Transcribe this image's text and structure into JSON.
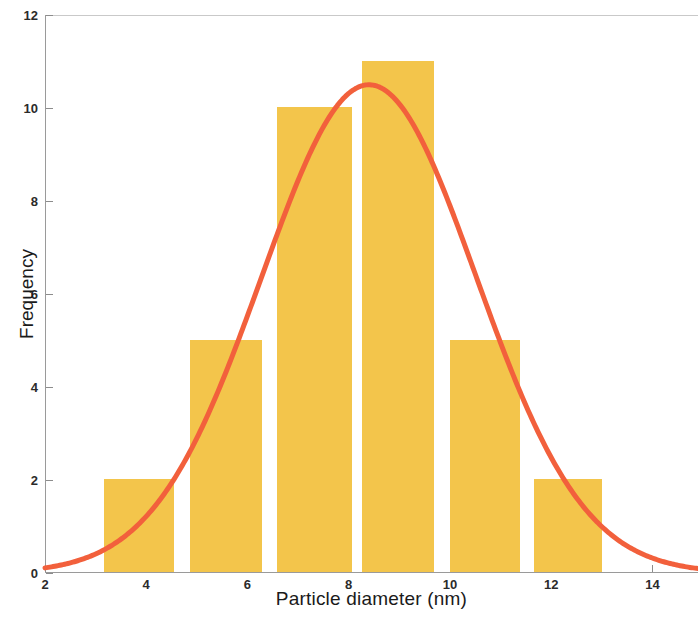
{
  "chart_data": {
    "type": "bar",
    "title": "",
    "subtitle": "",
    "xlabel": "Particle diameter (nm)",
    "ylabel": "Frequency",
    "xlim": [
      2,
      14.9
    ],
    "ylim": [
      0,
      12
    ],
    "xticks": [
      2,
      4,
      6,
      8,
      10,
      12,
      14
    ],
    "yticks": [
      0,
      2,
      4,
      6,
      8,
      10,
      12
    ],
    "xtick_labels": [
      "2",
      "4",
      "6",
      "8",
      "10",
      "12",
      "14"
    ],
    "ytick_labels": [
      "0",
      "2",
      "4",
      "6",
      "8",
      "10",
      "12"
    ],
    "grid": false,
    "legend": null,
    "bar_color": "#f3c54b",
    "curve_color": "#f2603c",
    "axis_color": "#9a9a9a",
    "bins": [
      {
        "label": "3.2-4.6",
        "x_start": 3.17,
        "x_end": 4.55,
        "value": 2
      },
      {
        "label": "4.9-6.3",
        "x_start": 4.87,
        "x_end": 6.29,
        "value": 5
      },
      {
        "label": "6.6-8.1",
        "x_start": 6.58,
        "x_end": 8.06,
        "value": 10
      },
      {
        "label": "8.3-9.7",
        "x_start": 8.26,
        "x_end": 9.68,
        "value": 11
      },
      {
        "label": "10.0-11.4",
        "x_start": 10.0,
        "x_end": 11.39,
        "value": 5
      },
      {
        "label": "11.7-13.0",
        "x_start": 11.67,
        "x_end": 13.0,
        "value": 2
      }
    ],
    "categories": [
      "3.2-4.6",
      "4.9-6.3",
      "6.6-8.1",
      "8.3-9.7",
      "10.0-11.4",
      "11.7-13.0"
    ],
    "values": [
      2,
      5,
      10,
      11,
      5,
      2
    ],
    "total_count": 35,
    "fit_curve": {
      "name": "gaussian fit",
      "type": "line",
      "peak_x": 8.4,
      "peak_y": 10.5,
      "sigma": 2.12,
      "x_start": 2.0,
      "y_at_x_start": 0.3,
      "x_end": 14.9,
      "y_at_x_end": 0.12
    }
  }
}
